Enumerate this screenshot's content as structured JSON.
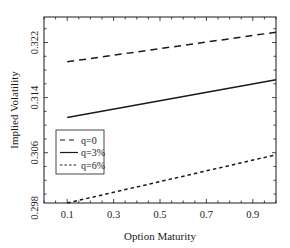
{
  "chart_data": {
    "type": "line",
    "title": "",
    "xlabel": "Option Maturity",
    "ylabel": "Implied Volatility",
    "xlim": [
      0.0,
      1.0
    ],
    "ylim": [
      0.2987,
      0.3257
    ],
    "xticks": [
      0.1,
      0.3,
      0.5,
      0.7,
      0.9
    ],
    "xtick_labels": [
      "0.1",
      "0.3",
      "0.5",
      "0.7",
      "0.9"
    ],
    "yticks": [
      0.298,
      0.306,
      0.314,
      0.322
    ],
    "ytick_labels": [
      "0.298",
      "0.306",
      "0.314",
      "0.322"
    ],
    "grid": false,
    "legend_position": "center-left",
    "x": [
      0.1,
      1.0
    ],
    "series": [
      {
        "name": "q=0",
        "style": "long-dash",
        "values": [
          0.3192,
          0.3235
        ]
      },
      {
        "name": "q=3%",
        "style": "solid",
        "values": [
          0.3111,
          0.3166
        ]
      },
      {
        "name": "q=6%",
        "style": "short-dash",
        "values": [
          0.2987,
          0.3057
        ]
      }
    ]
  },
  "colors": {
    "line": "#1a1a1a",
    "frame": "#1a1a1a",
    "background": "#ffffff"
  }
}
